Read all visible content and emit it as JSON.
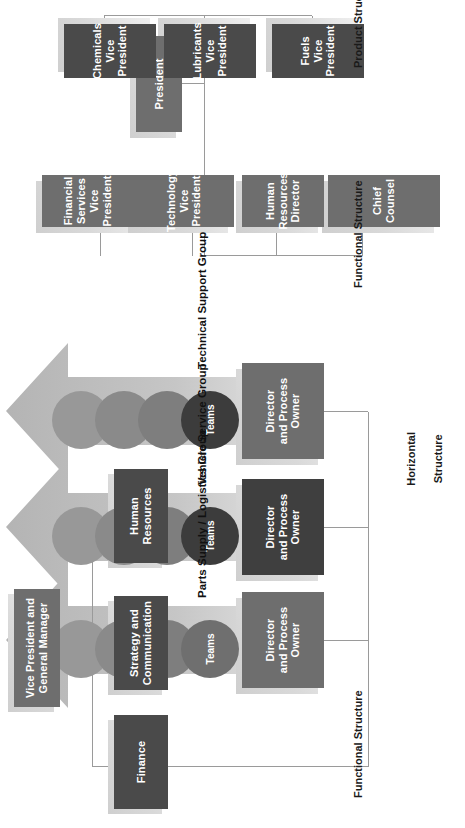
{
  "diagram": {
    "sections": {
      "top_functional": {
        "caption": "Functional Structure",
        "root": "Vice President and\nGeneral Manager",
        "root_line1": "Vice President and",
        "root_line2": "General Manager",
        "children": [
          {
            "label": "Finance"
          },
          {
            "label": "Strategy and\nCommunication",
            "line1": "Strategy and",
            "line2": "Communication"
          },
          {
            "label": "Human\nResources",
            "line1": "Human",
            "line2": "Resources"
          }
        ]
      },
      "horizontal": {
        "caption": "Horizontal\nStructure",
        "caption_line1": "Horizontal",
        "caption_line2": "Structure",
        "groups": [
          {
            "name": "Parts Supply / Logistics Group",
            "director": "Director\nand Process\nOwner",
            "director_line1": "Director",
            "director_line2": "and Process",
            "director_line3": "Owner",
            "teams_label": "Teams",
            "team_count": 4,
            "director_tone": "medium",
            "front_circle_tone": "medium"
          },
          {
            "name": "Vehicle Service Group",
            "director": "Director\nand Process\nOwner",
            "director_line1": "Director",
            "director_line2": "and Process",
            "director_line3": "Owner",
            "teams_label": "Teams",
            "team_count": 4,
            "director_tone": "dark",
            "front_circle_tone": "dark"
          },
          {
            "name": "Technical Support Group",
            "director": "Director\nand Process\nOwner",
            "director_line1": "Director",
            "director_line2": "and Process",
            "director_line3": "Owner",
            "teams_label": "Teams",
            "team_count": 4,
            "director_tone": "medium",
            "front_circle_tone": "dark"
          }
        ]
      },
      "bottom_functional": {
        "caption": "Functional Structure",
        "root": "President",
        "children": [
          {
            "label": "Chief Counsel",
            "line1": "Chief Counsel",
            "line2": ""
          },
          {
            "label": "Human\nResources\nDirector",
            "line1": "Human",
            "line2": "Resources",
            "line3": "Director"
          },
          {
            "label": "Technology\nVice President",
            "line1": "Technology",
            "line2": "Vice President"
          },
          {
            "label": "Financial\nServices\nVice President",
            "line1": "Financial",
            "line2": "Services",
            "line3": "Vice President"
          }
        ]
      },
      "product": {
        "caption": "Product Structure",
        "children": [
          {
            "label": "Fuels\nVice President",
            "line1": "Fuels",
            "line2": "Vice President"
          },
          {
            "label": "Lubricants\nVice President",
            "line1": "Lubricants",
            "line2": "Vice President"
          },
          {
            "label": "Chemicals\nVice President",
            "line1": "Chemicals",
            "line2": "Vice President"
          }
        ]
      }
    },
    "colors": {
      "box_medium": "#6e6e6e",
      "box_dark": "#4a4a4a",
      "shadow_plate": "#d2d2d2",
      "connector": "#9a9a9a",
      "arrow_fill": "#bdbdbd",
      "text_on_box": "#ffffff",
      "caption_text": "#1a1a1a"
    }
  }
}
